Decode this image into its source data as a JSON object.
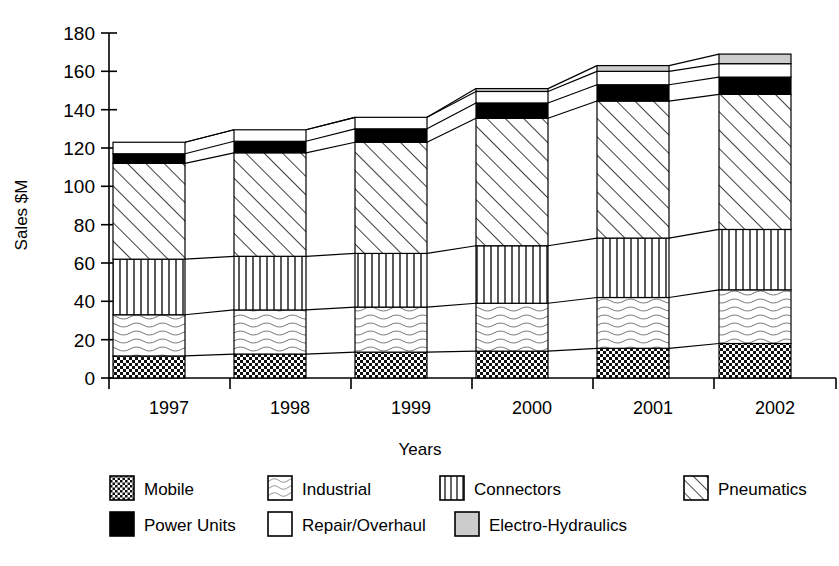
{
  "chart_data": {
    "type": "bar",
    "subtype": "stacked-bar",
    "title": "",
    "xlabel": "Years",
    "ylabel": "Sales $M",
    "categories": [
      "1997",
      "1998",
      "1999",
      "2000",
      "2001",
      "2002"
    ],
    "ylim": [
      0,
      180
    ],
    "ytick_step": 20,
    "yticks": [
      0,
      20,
      40,
      60,
      80,
      100,
      120,
      140,
      160,
      180
    ],
    "ytick_labels": [
      "0",
      "20",
      "40",
      "60",
      "80",
      "100",
      "120",
      "140",
      "160",
      "180"
    ],
    "grid": false,
    "legend_position": "bottom",
    "series": [
      {
        "name": "Mobile",
        "fill": "checker",
        "values": [
          11.5,
          12.5,
          13.5,
          14.0,
          15.5,
          18.0
        ]
      },
      {
        "name": "Industrial",
        "fill": "wavy",
        "values": [
          21.5,
          23.0,
          23.5,
          25.0,
          26.5,
          28.0
        ]
      },
      {
        "name": "Connectors",
        "fill": "vertical",
        "values": [
          29.0,
          28.0,
          28.0,
          30.0,
          31.0,
          31.5
        ]
      },
      {
        "name": "Pneumatics",
        "fill": "diagonal",
        "values": [
          50.0,
          54.0,
          58.0,
          66.5,
          71.5,
          70.5
        ]
      },
      {
        "name": "Power Units",
        "fill": "solid-black",
        "values": [
          5.0,
          6.0,
          7.0,
          8.0,
          8.5,
          9.0
        ]
      },
      {
        "name": "Repair/Overhaul",
        "fill": "white",
        "values": [
          6.0,
          6.0,
          6.0,
          6.0,
          7.0,
          7.0
        ]
      },
      {
        "name": "Electro-Hydraulics",
        "fill": "light-gray",
        "values": [
          0.0,
          0.0,
          0.0,
          1.5,
          3.0,
          5.0
        ]
      }
    ],
    "totals": [
      123.0,
      129.5,
      136.0,
      151.0,
      163.0,
      169.0
    ],
    "cumulative_tops": [
      [
        11.5,
        33.0,
        62.0,
        112.0,
        117.0,
        123.0,
        123.0
      ],
      [
        12.5,
        35.5,
        63.5,
        117.5,
        123.5,
        129.5,
        129.5
      ],
      [
        13.5,
        37.0,
        65.0,
        123.0,
        130.0,
        136.0,
        136.0
      ],
      [
        14.0,
        39.0,
        69.0,
        135.5,
        143.5,
        149.5,
        151.0
      ],
      [
        15.5,
        42.0,
        73.0,
        144.5,
        153.0,
        160.0,
        163.0
      ],
      [
        18.0,
        46.0,
        77.5,
        148.0,
        157.0,
        164.0,
        169.0
      ]
    ]
  },
  "axes": {
    "y_label": "Sales $M",
    "x_label": "Years"
  },
  "legend": {
    "row1": [
      {
        "label": "Mobile",
        "fill": "checker"
      },
      {
        "label": "Industrial",
        "fill": "wavy"
      },
      {
        "label": "Connectors",
        "fill": "vertical"
      },
      {
        "label": "Pneumatics",
        "fill": "diagonal"
      }
    ],
    "row2": [
      {
        "label": "Power Units",
        "fill": "solid-black"
      },
      {
        "label": "Repair/Overhaul",
        "fill": "white"
      },
      {
        "label": "Electro-Hydraulics",
        "fill": "light-gray"
      }
    ]
  },
  "colors": {
    "ink": "#000000",
    "paper": "#ffffff",
    "light_gray": "#cccccc",
    "solid_black": "#000000"
  }
}
